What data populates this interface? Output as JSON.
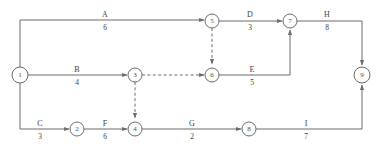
{
  "diagram": {
    "type": "aoa-network",
    "stroke_color": "#6b6b6b",
    "text_color": "#3d3d3d",
    "background": "#ffffff",
    "nodes": [
      {
        "id": "1",
        "label": "1",
        "cx": 20,
        "cy": 75,
        "r": 8
      },
      {
        "id": "2",
        "label": "2",
        "cx": 77,
        "cy": 129,
        "r": 7
      },
      {
        "id": "3",
        "label": "3",
        "cx": 135,
        "cy": 75,
        "r": 7
      },
      {
        "id": "4",
        "label": "4",
        "cx": 135,
        "cy": 129,
        "r": 7
      },
      {
        "id": "5",
        "label": "5",
        "cx": 212,
        "cy": 21,
        "r": 7
      },
      {
        "id": "6",
        "label": "6",
        "cx": 212,
        "cy": 75,
        "r": 7
      },
      {
        "id": "7",
        "label": "7",
        "cx": 290,
        "cy": 21,
        "r": 7
      },
      {
        "id": "8",
        "label": "8",
        "cx": 249,
        "cy": 129,
        "r": 7
      },
      {
        "id": "9",
        "label": "9",
        "cx": 362,
        "cy": 75,
        "r": 8
      }
    ],
    "edges": [
      {
        "id": "A",
        "name": "A",
        "duration": "6",
        "from": "1",
        "to": "5",
        "label_x": 105,
        "label_y": 20,
        "dummy": false
      },
      {
        "id": "B",
        "name": "B",
        "duration": "4",
        "from": "1",
        "to": "3",
        "label_x": 77,
        "label_y": 75,
        "dummy": false
      },
      {
        "id": "C",
        "name": "C",
        "duration": "3",
        "from": "1",
        "to": "2",
        "label_x": 40,
        "label_y": 129,
        "dummy": false
      },
      {
        "id": "D",
        "name": "D",
        "duration": "3",
        "from": "5",
        "to": "7",
        "label_x": 250,
        "label_y": 20,
        "dummy": false
      },
      {
        "id": "E",
        "name": "E",
        "duration": "5",
        "from": "6",
        "to": "7",
        "label_x": 252,
        "label_y": 75,
        "dummy": false
      },
      {
        "id": "F",
        "name": "F",
        "duration": "6",
        "from": "2",
        "to": "4",
        "label_x": 105,
        "label_y": 129,
        "dummy": false
      },
      {
        "id": "G",
        "name": "G",
        "duration": "2",
        "from": "4",
        "to": "8",
        "label_x": 192,
        "label_y": 129,
        "dummy": false
      },
      {
        "id": "H",
        "name": "H",
        "duration": "8",
        "from": "7",
        "to": "9",
        "label_x": 327,
        "label_y": 20,
        "dummy": false
      },
      {
        "id": "I",
        "name": "I",
        "duration": "7",
        "from": "8",
        "to": "9",
        "label_x": 306,
        "label_y": 129,
        "dummy": false
      },
      {
        "id": "dummy-5-6",
        "name": "",
        "duration": "",
        "from": "5",
        "to": "6",
        "dummy": true
      },
      {
        "id": "dummy-3-6",
        "name": "",
        "duration": "",
        "from": "3",
        "to": "6",
        "dummy": true
      },
      {
        "id": "dummy-3-4",
        "name": "",
        "duration": "",
        "from": "3",
        "to": "4",
        "dummy": true
      }
    ]
  }
}
